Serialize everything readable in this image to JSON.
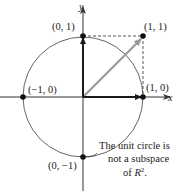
{
  "figure": {
    "axes": {
      "x_label": "x",
      "y_label": "y"
    },
    "points": [
      {
        "id": "p01",
        "label": "(0, 1)"
      },
      {
        "id": "p11",
        "label": "(1, 1)"
      },
      {
        "id": "pm10",
        "label": "(−1, 0)"
      },
      {
        "id": "p10",
        "label": "(1, 0)"
      },
      {
        "id": "p0m1",
        "label": "(0, −1)"
      }
    ],
    "caption": {
      "line1": "The unit circle is",
      "line2": "not a subspace",
      "line3_prefix": "of ",
      "line3_var": "R",
      "line3_sup": "2",
      "line3_suffix": "."
    },
    "colors": {
      "axis": "#333333",
      "circle": "#555555",
      "vector_basis": "#1a1a1a",
      "vector_sum": "#9a9a9a",
      "dashed": "#444444",
      "point": "#111111"
    }
  }
}
